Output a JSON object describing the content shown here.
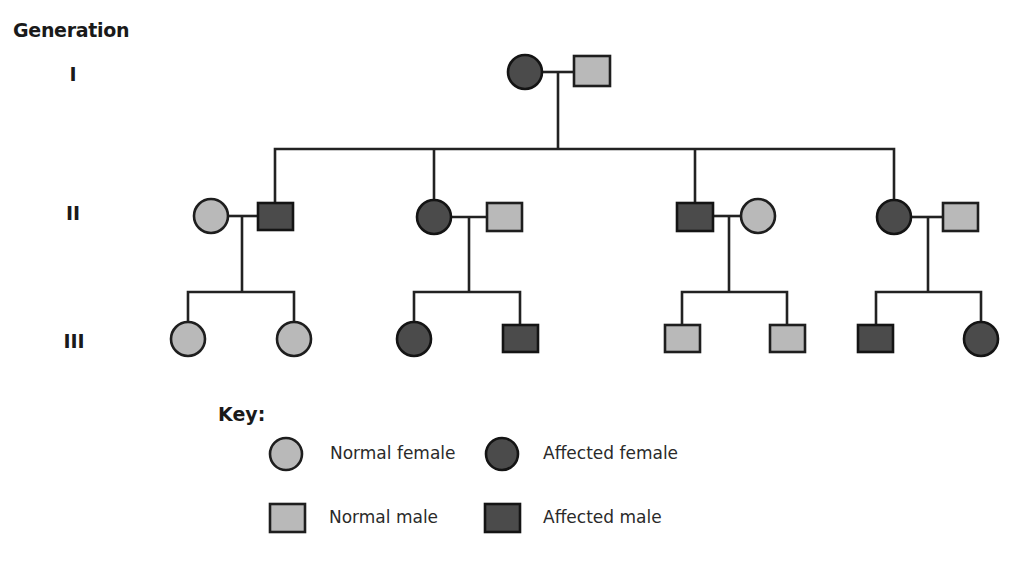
{
  "title": "Generation",
  "generations": [
    {
      "label": "I",
      "x": 53,
      "y": 63
    },
    {
      "label": "II",
      "x": 53,
      "y": 202
    },
    {
      "label": "III",
      "x": 53,
      "y": 330
    }
  ],
  "colors": {
    "normal": "#b9b9b9",
    "affected": "#4b4b4b",
    "line": "#222222"
  },
  "pedigree": {
    "generation_I": [
      {
        "id": "I-1",
        "sex": "female",
        "status": "affected"
      },
      {
        "id": "I-2",
        "sex": "male",
        "status": "normal"
      }
    ],
    "generation_II": [
      {
        "id": "II-1",
        "sex": "female",
        "status": "normal",
        "note": "married-in"
      },
      {
        "id": "II-2",
        "sex": "male",
        "status": "affected"
      },
      {
        "id": "II-3",
        "sex": "female",
        "status": "affected"
      },
      {
        "id": "II-4",
        "sex": "male",
        "status": "normal",
        "note": "married-in"
      },
      {
        "id": "II-5",
        "sex": "male",
        "status": "affected"
      },
      {
        "id": "II-6",
        "sex": "female",
        "status": "normal",
        "note": "married-in"
      },
      {
        "id": "II-7",
        "sex": "female",
        "status": "affected"
      },
      {
        "id": "II-8",
        "sex": "male",
        "status": "normal",
        "note": "married-in"
      }
    ],
    "generation_III": [
      {
        "id": "III-1",
        "sex": "female",
        "status": "normal"
      },
      {
        "id": "III-2",
        "sex": "female",
        "status": "normal"
      },
      {
        "id": "III-3",
        "sex": "female",
        "status": "affected"
      },
      {
        "id": "III-4",
        "sex": "male",
        "status": "affected"
      },
      {
        "id": "III-5",
        "sex": "male",
        "status": "normal"
      },
      {
        "id": "III-6",
        "sex": "male",
        "status": "normal"
      },
      {
        "id": "III-7",
        "sex": "male",
        "status": "affected"
      },
      {
        "id": "III-8",
        "sex": "female",
        "status": "affected"
      }
    ]
  },
  "key": {
    "title": "Key:",
    "items": [
      {
        "label": "Normal female",
        "symbol": "circle",
        "status": "normal"
      },
      {
        "label": "Affected female",
        "symbol": "circle",
        "status": "affected"
      },
      {
        "label": "Normal male",
        "symbol": "square",
        "status": "normal"
      },
      {
        "label": "Affected male",
        "symbol": "square",
        "status": "affected"
      }
    ]
  }
}
